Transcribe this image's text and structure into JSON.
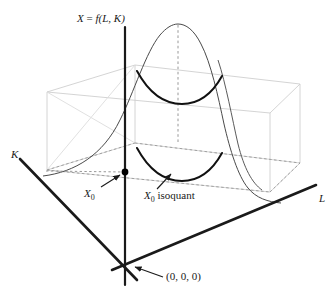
{
  "figure": {
    "kind": "3d-surface-diagram",
    "width": 334,
    "height": 303,
    "background_color": "#ffffff"
  },
  "labels": {
    "surface_title": "X = f(L, K)",
    "surface_title_parts": {
      "lhs": "X",
      "eq": " = ",
      "fn": "f",
      "args": "(L, K)"
    },
    "k_axis": "K",
    "l_axis": "L",
    "x0_point": "X",
    "x0_point_sub": "0",
    "isoquant": "X",
    "isoquant_sub": "0",
    "isoquant_word": " isoquant",
    "origin": "(0, 0, 0)"
  },
  "colors": {
    "axis": "#1a1a1a",
    "curve": "#3b3b3b",
    "isoquant": "#111111",
    "box": "#cccccc",
    "dashed": "#9a9a9a",
    "dot": "#000000",
    "arrow": "#1a1a1a",
    "text": "#1a1a1a"
  },
  "geometry": {
    "origin_px": [
      125,
      272
    ],
    "vertical_axis": {
      "x": 125,
      "y_top": 27,
      "y_bottom": 285
    },
    "k_axis": {
      "from": [
        20,
        159
      ],
      "to": [
        137,
        280
      ]
    },
    "l_axis": {
      "from": [
        112,
        270
      ],
      "to": [
        316,
        185
      ]
    },
    "x0_dot": [
      125,
      172
    ],
    "apex_dashed": {
      "x": 178,
      "y_top": 25,
      "y_bottom": 143
    },
    "box": {
      "front_left_bottom": [
        47,
        170
      ],
      "front_left_top": [
        47,
        92
      ],
      "front_right_bottom": [
        270,
        192
      ],
      "front_right_top": [
        270,
        113
      ],
      "back_left_bottom": [
        135,
        143
      ],
      "back_left_top": [
        135,
        65
      ],
      "back_right_bottom": [
        300,
        163
      ],
      "back_right_top": [
        300,
        84
      ]
    }
  },
  "annotations": [
    {
      "name": "x0-arrow",
      "from": [
        101,
        186
      ],
      "to": [
        120,
        175
      ]
    },
    {
      "name": "isoquant-arrow",
      "from": [
        158,
        188
      ],
      "to": [
        172,
        174
      ]
    },
    {
      "name": "origin-arrow",
      "from": [
        163,
        276
      ],
      "to": [
        134,
        266
      ]
    }
  ]
}
